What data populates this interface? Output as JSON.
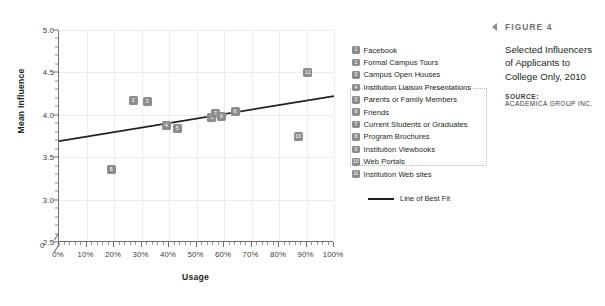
{
  "chart_data": {
    "type": "scatter",
    "title": "Selected Influencers of Applicants to College Only, 2010",
    "xlabel": "Usage",
    "ylabel": "Mean Influence",
    "xlim": [
      0,
      100
    ],
    "ylim": [
      2.5,
      5.0
    ],
    "y_axis_break": true,
    "y_zero_label": "0",
    "xticklabels": [
      "0%",
      "10%",
      "20%",
      "30%",
      "40%",
      "50%",
      "60%",
      "70%",
      "80%",
      "90%",
      "100%"
    ],
    "xtickvalues": [
      0,
      10,
      20,
      30,
      40,
      50,
      60,
      70,
      80,
      90,
      100
    ],
    "yticklabels": [
      "2.5",
      "3.0",
      "3.5",
      "4.0",
      "4.5",
      "5.0"
    ],
    "ytickvalues": [
      2.5,
      3.0,
      3.5,
      4.0,
      4.5,
      5.0
    ],
    "grid": true,
    "legend_position": "right",
    "points": [
      {
        "id": 1,
        "label": "Facebook",
        "x": 55.5,
        "y": 3.97
      },
      {
        "id": 2,
        "label": "Formal Campus Tours",
        "x": 27.0,
        "y": 4.17
      },
      {
        "id": 3,
        "label": "Campus Open Houses",
        "x": 32.0,
        "y": 4.16
      },
      {
        "id": 4,
        "label": "Institution Liaison Presentations",
        "x": 39.0,
        "y": 3.87
      },
      {
        "id": 5,
        "label": "Parents or Family Members",
        "x": 43.0,
        "y": 3.84
      },
      {
        "id": 6,
        "label": "Friends",
        "x": 64.0,
        "y": 4.04
      },
      {
        "id": 7,
        "label": "Current Students or Graduates",
        "x": 56.8,
        "y": 4.01
      },
      {
        "id": 8,
        "label": "Program Brochures",
        "x": 19.0,
        "y": 3.35
      },
      {
        "id": 9,
        "label": "Institution Viewbooks",
        "x": 59.0,
        "y": 3.98
      },
      {
        "id": 10,
        "label": "Web Portals",
        "x": 87.0,
        "y": 3.75
      },
      {
        "id": 11,
        "label": "Institution Web sites",
        "x": 90.5,
        "y": 4.5
      }
    ],
    "trendline": {
      "label": "Line of Best Fit",
      "x0": 0,
      "y0": 3.69,
      "x1": 100,
      "y1": 4.22,
      "color": "#231f20"
    },
    "marker_color": "#8a8c8e",
    "grid_color": "#eceded",
    "axis_color": "#6d6e70"
  },
  "caption": {
    "figure_label": "FIGURE 4",
    "title": "Selected Influencers of Applicants to College Only, 2010",
    "source_label": "SOURCE:",
    "source": "ACADEMICA GROUP INC."
  }
}
